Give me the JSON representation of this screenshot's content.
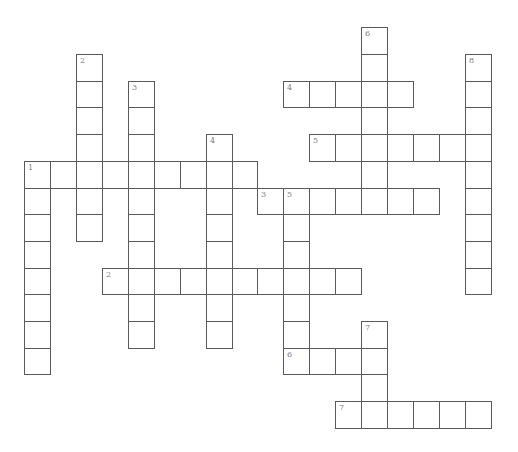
{
  "grid": {
    "origin_x": 24.3,
    "origin_y": 27.3,
    "cell_w": 25.9,
    "cell_h": 26.7,
    "line_color": "#5a5a5a",
    "number_color": "#808080"
  },
  "words": [
    {
      "number": "1",
      "direction": "across",
      "row": 5,
      "col": 0,
      "length": 9
    },
    {
      "number": "1",
      "direction": "down",
      "row": 5,
      "col": 0,
      "length": 8
    },
    {
      "number": "2",
      "direction": "down",
      "row": 1,
      "col": 2,
      "length": 7
    },
    {
      "number": "2",
      "direction": "across",
      "row": 9,
      "col": 3,
      "length": 10
    },
    {
      "number": "3",
      "direction": "down",
      "row": 2,
      "col": 4,
      "length": 10
    },
    {
      "number": "3",
      "direction": "across",
      "row": 6,
      "col": 9,
      "length": 7
    },
    {
      "number": "4",
      "direction": "down",
      "row": 4,
      "col": 7,
      "length": 8
    },
    {
      "number": "4",
      "direction": "across",
      "row": 2,
      "col": 10,
      "length": 5
    },
    {
      "number": "5",
      "direction": "across",
      "row": 4,
      "col": 11,
      "length": 7
    },
    {
      "number": "5",
      "direction": "down",
      "row": 6,
      "col": 10,
      "length": 7
    },
    {
      "number": "6",
      "direction": "down",
      "row": 0,
      "col": 13,
      "length": 7
    },
    {
      "number": "6",
      "direction": "across",
      "row": 12,
      "col": 10,
      "length": 4
    },
    {
      "number": "7",
      "direction": "down",
      "row": 11,
      "col": 13,
      "length": 4
    },
    {
      "number": "7",
      "direction": "across",
      "row": 14,
      "col": 12,
      "length": 6
    },
    {
      "number": "8",
      "direction": "down",
      "row": 1,
      "col": 17,
      "length": 9
    }
  ]
}
